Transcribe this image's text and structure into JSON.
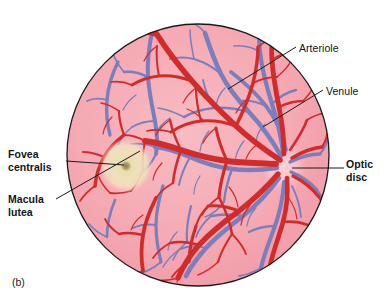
{
  "figure": {
    "caption": "(b)",
    "kind": "retinal-fundus-diagram",
    "title_absent": true
  },
  "labels": {
    "fovea_centralis": "Fovea\ncentralis",
    "macula_lutea": "Macula\nlutea",
    "arteriole": "Arteriole",
    "venule": "Venule",
    "optic_disc": "Optic\ndisc"
  },
  "colors": {
    "retina_background": "#f4a3ad",
    "retina_background_light": "#f8bcc3",
    "arteriole_red": "#d22b2b",
    "arteriole_red_dark": "#b01c1c",
    "venule_blue": "#7a7ebd",
    "venule_blue_dark": "#5f63a4",
    "macula_lutea": "#ede0b4",
    "macula_outer": "#f0dfb8",
    "fovea_center": "#9c8a5a",
    "optic_disc": "#f9c6cb",
    "outline": "#1a1a1a",
    "page_background": "#ffffff",
    "label_text": "#141414"
  },
  "geometry": {
    "circle_center_x": 198,
    "circle_center_y": 155,
    "circle_radius": 132,
    "macula_center_x": 126,
    "macula_center_y": 166,
    "macula_radius": 26,
    "fovea_radius": 5,
    "optic_disc_center_x": 283,
    "optic_disc_center_y": 166,
    "optic_disc_radius_x": 22,
    "optic_disc_radius_y": 26
  },
  "leader_lines": {
    "fovea": "from label right edge to fovea center (horizontal)",
    "macula": "from label right edge diagonally up to macula border",
    "arteriole": "from label left edge diagonally down-left into arteriole",
    "venule": "from label left edge diagonally down-left into venule",
    "optic_disc": "from label left edge horizontally left into optic disc"
  }
}
